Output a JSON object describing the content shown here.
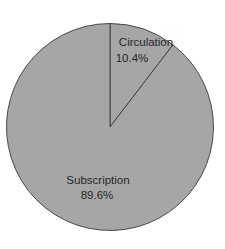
{
  "chart_data": {
    "type": "pie",
    "title": "",
    "slices": [
      {
        "label": "Circulation",
        "value": 10.4,
        "display": "10.4%",
        "color": "#a6a6a6"
      },
      {
        "label": "Subscription",
        "value": 89.6,
        "display": "89.6%",
        "color": "#a6a6a6"
      }
    ],
    "start_angle": "12 o'clock",
    "direction": "clockwise",
    "legend": "none",
    "data_labels": "inside"
  }
}
